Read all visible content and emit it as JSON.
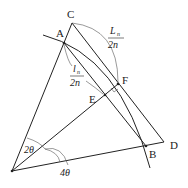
{
  "diagram": {
    "points": {
      "O": {
        "x": 12,
        "y": 171,
        "label": ""
      },
      "A": {
        "x": 64,
        "y": 43,
        "label": "A"
      },
      "C": {
        "x": 72,
        "y": 23,
        "label": "C"
      },
      "F": {
        "x": 118,
        "y": 84,
        "label": "F"
      },
      "E": {
        "x": 105,
        "y": 95,
        "label": "E"
      },
      "B": {
        "x": 146,
        "y": 146,
        "label": "B"
      },
      "D": {
        "x": 164,
        "y": 142,
        "label": "D"
      }
    },
    "labels": {
      "C": "C",
      "A": "A",
      "F": "F",
      "E": "E",
      "B": "B",
      "D": "D",
      "Ln_num": "L",
      "Ln_sub": "n",
      "Ln_den": "2n",
      "ln_num": "l",
      "ln_sub": "n",
      "ln_den": "2n",
      "angle_small": "2θ",
      "angle_large": "4θ"
    }
  }
}
